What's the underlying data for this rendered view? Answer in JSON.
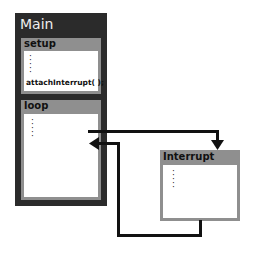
{
  "diagram": {
    "main": {
      "title": "Main"
    },
    "setup": {
      "title": "setup",
      "code": "attachInterrupt( );",
      "dots": "⋮"
    },
    "loop": {
      "title": "loop",
      "dots": "⋮"
    },
    "interrupt": {
      "title": "Interrupt",
      "dots": "⋮"
    },
    "arrows": [
      {
        "from": "loop",
        "to": "interrupt",
        "label": ""
      },
      {
        "from": "interrupt",
        "to": "loop",
        "label": ""
      }
    ],
    "colors": {
      "main_bg": "#2b2b2b",
      "panel_header": "#8f8f8f",
      "arrow": "#111111"
    }
  }
}
